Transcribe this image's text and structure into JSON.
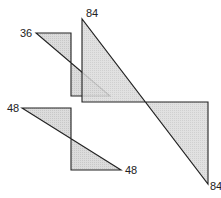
{
  "colors": {
    "fill": "#d4d4d4",
    "stroke": "#222222",
    "background": "#ffffff"
  },
  "shapes": [
    {
      "name": "shape-36",
      "points": "36,33 71,33 71,96 110,96",
      "labels": [
        {
          "text": "36",
          "x": 20,
          "y": 37
        }
      ]
    },
    {
      "name": "shape-84",
      "points": "82,19 82,102 208,102 208,184",
      "labels": [
        {
          "text": "84",
          "x": 86,
          "y": 17
        },
        {
          "text": "84",
          "x": 211,
          "y": 190
        }
      ]
    },
    {
      "name": "shape-48",
      "points": "22,108 71,108 71,170 121,170",
      "labels": [
        {
          "text": "48",
          "x": 7,
          "y": 112
        },
        {
          "text": "48",
          "x": 125,
          "y": 174
        }
      ]
    }
  ],
  "labels": {
    "l36": "36",
    "l84a": "84",
    "l84b": "84",
    "l48a": "48",
    "l48b": "48"
  }
}
